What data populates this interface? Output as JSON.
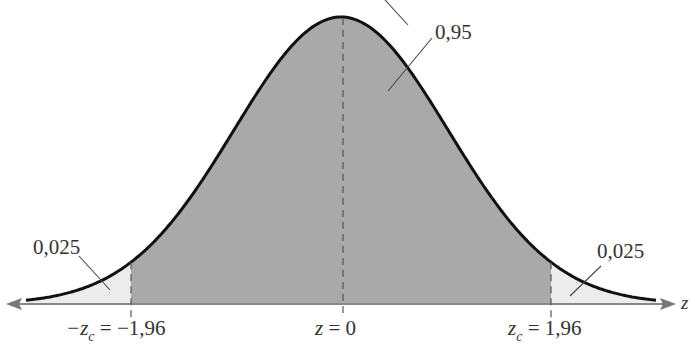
{
  "chart_data": {
    "type": "area",
    "title": "",
    "xlabel": "z",
    "ylabel": "",
    "distribution": "standard normal",
    "regions": [
      {
        "name": "left tail",
        "from": "-inf",
        "to": -1.96,
        "area": 0.025,
        "label": "0,025",
        "fill": "#ececec"
      },
      {
        "name": "center",
        "from": -1.96,
        "to": 1.96,
        "area": 0.95,
        "label": "0,95",
        "fill": "#a9a9a9"
      },
      {
        "name": "right tail",
        "from": 1.96,
        "to": "inf",
        "area": 0.025,
        "label": "0,025",
        "fill": "#ececec"
      }
    ],
    "markers": [
      {
        "x": -1.96,
        "label": "-z_c = -1,96",
        "style": "dashed"
      },
      {
        "x": 0,
        "label": "z = 0",
        "style": "dashed"
      },
      {
        "x": 1.96,
        "label": "z_c = 1,96",
        "style": "dashed"
      }
    ],
    "xlim": [
      -3.3,
      3.3
    ]
  },
  "labels": {
    "center_area": "0,95",
    "left_area": "0,025",
    "right_area": "0,025",
    "left_crit_prefix": "−z",
    "left_crit_sub": "c",
    "left_crit_value": " = −1,96",
    "mean_z": "z",
    "mean_value": " = 0",
    "right_crit_prefix": "z",
    "right_crit_sub": "c",
    "right_crit_value": " = 1,96",
    "axis_var": "z"
  },
  "colors": {
    "center_fill": "#a9a9a9",
    "tail_fill": "#ececec",
    "curve": "#111111",
    "axis": "#777777"
  }
}
